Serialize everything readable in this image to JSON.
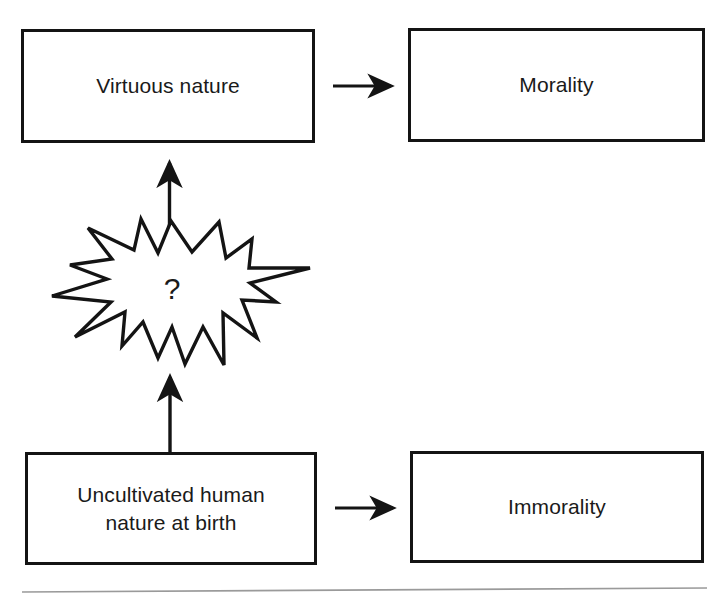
{
  "figure": {
    "background_color": "#ffffff",
    "stroke_color": "#141414",
    "text_color": "#1a1a1a",
    "rule_color": "#9a9a9a"
  },
  "nodes": {
    "virtuous_nature": {
      "label": "Virtuous nature"
    },
    "morality": {
      "label": "Morality"
    },
    "uncultivated_human_nature": {
      "label": "Uncultivated human\nnature at birth"
    },
    "immorality": {
      "label": "Immorality"
    }
  },
  "burst": {
    "label": "?",
    "points": 13
  },
  "arrows": {
    "virtuous_to_morality": {
      "direction": "right"
    },
    "uncultivated_to_immorality": {
      "direction": "right"
    },
    "burst_to_virtuous": {
      "direction": "up"
    },
    "uncultivated_to_burst": {
      "direction": "up"
    }
  },
  "footer_rule": {
    "visible": true
  }
}
